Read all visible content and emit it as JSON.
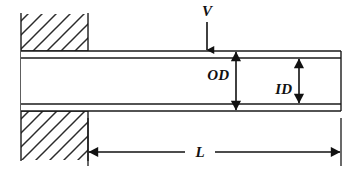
{
  "figure": {
    "kind": "engineering-diagram",
    "background_color": "#ffffff",
    "line_color": "#1a1a1a",
    "hatch_color": "#2b2b2b"
  },
  "labels": {
    "load": "V",
    "outer_diameter": "OD",
    "inner_diameter": "ID",
    "length": "L"
  },
  "geometry": {
    "canvas": {
      "width": 354,
      "height": 173
    },
    "wall": {
      "left_x": 21,
      "right_x": 88,
      "top_y": 14,
      "bottom_y": 160,
      "upper_block": {
        "top_y": 14,
        "bottom_y": 51
      },
      "lower_block": {
        "top_y": 111,
        "bottom_y": 160
      },
      "hatch_spacing": 14,
      "hatch_angle_deg": 45
    },
    "tube": {
      "left_x": 88,
      "right_x": 341,
      "outer_top_y": 51,
      "inner_top_y": 58,
      "inner_bottom_y": 104,
      "outer_bottom_y": 111
    },
    "load_arrow": {
      "x": 207,
      "top_y": 22,
      "tip_y": 51
    },
    "od_arrow": {
      "x": 236,
      "top_y": 51,
      "bottom_y": 111
    },
    "id_arrow": {
      "x": 299,
      "top_y": 58,
      "bottom_y": 104
    },
    "length_dimension": {
      "y": 152,
      "left_x": 88,
      "right_x": 341,
      "label_gap_left": 185,
      "label_gap_right": 215,
      "extension_left_x": 88,
      "extension_right_x": 341
    }
  },
  "label_positions": {
    "load": {
      "x": 207,
      "y": 16
    },
    "outer_diameter": {
      "x": 230,
      "y": 79
    },
    "inner_diameter": {
      "x": 293,
      "y": 93
    },
    "length": {
      "x": 200,
      "y": 157
    }
  }
}
